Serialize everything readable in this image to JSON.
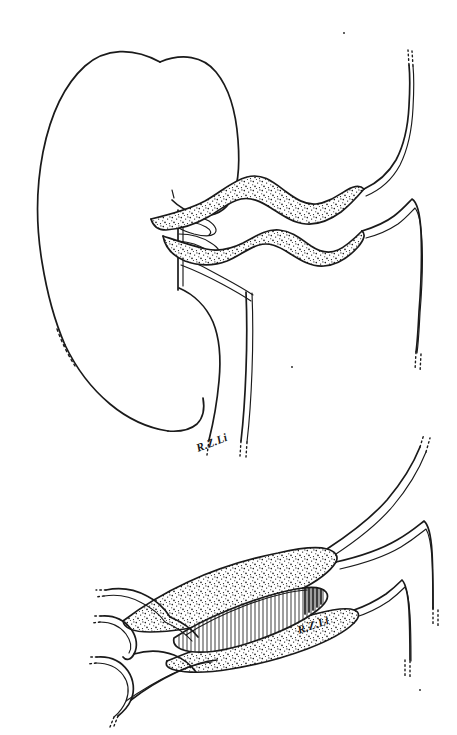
{
  "figure": {
    "medium": "pen-and-ink line drawing",
    "background_color": "#ffffff",
    "ink_color": "#1a1a1a",
    "canvas": {
      "width": 457,
      "height": 735
    },
    "panel_count": 2
  },
  "panels": [
    {
      "id": "upper",
      "name": "kidney-with-renal-vessels",
      "description": "Kidney in profile with renal hilum, tortuous stippled renal vessels, ureter, and great vessels",
      "signature": "R.Z.Li",
      "signature_position": {
        "x": 205,
        "y": 446
      },
      "structures": [
        {
          "name": "kidney-outline",
          "shading": "none"
        },
        {
          "name": "renal-hilum-branches",
          "shading": "none"
        },
        {
          "name": "tortuous-renal-vessel-upper",
          "shading": "stipple"
        },
        {
          "name": "tortuous-renal-vessel-lower",
          "shading": "stipple"
        },
        {
          "name": "ureter",
          "shading": "none"
        },
        {
          "name": "renal-pelvis",
          "shading": "none"
        },
        {
          "name": "great-vessel-superior",
          "shading": "none"
        },
        {
          "name": "great-vessel-inferior",
          "shading": "none"
        }
      ]
    },
    {
      "id": "lower",
      "name": "opened-vessel-segment",
      "description": "Magnified longitudinally opened vessel showing hatched inner lumen surrounded by stippled vessel wall, with three hooked branch vessels at left and two descending vessels at right",
      "signature": "R.Z.Li",
      "signature_position": {
        "x": 300,
        "y": 628
      },
      "structures": [
        {
          "name": "vessel-wall-upper-flap",
          "shading": "stipple"
        },
        {
          "name": "vessel-wall-lower-flap",
          "shading": "stipple"
        },
        {
          "name": "opened-lumen",
          "shading": "vertical-hatch"
        },
        {
          "name": "branch-vessel-1",
          "shading": "none"
        },
        {
          "name": "branch-vessel-2",
          "shading": "none"
        },
        {
          "name": "branch-vessel-3",
          "shading": "none"
        },
        {
          "name": "descending-vessel-left",
          "shading": "none"
        },
        {
          "name": "descending-vessel-right",
          "shading": "none"
        }
      ]
    }
  ],
  "signatures": {
    "upper_label": "R.Z.Li",
    "lower_label": "R.Z.Li"
  }
}
